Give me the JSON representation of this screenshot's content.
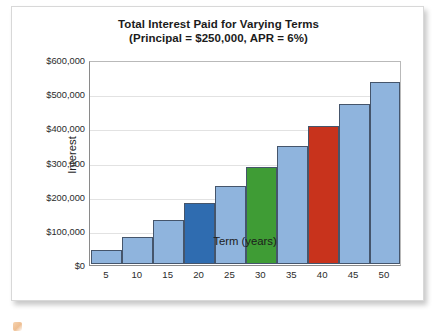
{
  "chart_data": {
    "type": "bar",
    "title": "Total Interest Paid for Varying Terms",
    "subtitle": "(Principal = $250,000, APR = 6%)",
    "xlabel": "Term (years)",
    "ylabel": "Interest",
    "categories": [
      "5",
      "10",
      "15",
      "20",
      "25",
      "30",
      "35",
      "40",
      "45",
      "50"
    ],
    "values": [
      40000,
      80000,
      130000,
      180000,
      232000,
      288000,
      348000,
      408000,
      473000,
      540000
    ],
    "ylim": [
      0,
      600000
    ],
    "ytick_labels": [
      "$600,000",
      "$500,000",
      "$400,000",
      "$300,000",
      "$200,000",
      "$100,000",
      "$0"
    ],
    "ytick_values": [
      600000,
      500000,
      400000,
      300000,
      200000,
      100000,
      0
    ],
    "grid": true,
    "legend": "none",
    "bar_colors": [
      "#8fb4dd",
      "#8fb4dd",
      "#8fb4dd",
      "#2f6cb0",
      "#8fb4dd",
      "#3f9c35",
      "#8fb4dd",
      "#c8331c",
      "#8fb4dd",
      "#8fb4dd"
    ],
    "colors": {
      "default_bar": "#8fb4dd",
      "highlight_blue": "#2f6cb0",
      "highlight_green": "#3f9c35",
      "highlight_red": "#c8331c",
      "bar_border": "#45556b",
      "gridline": "#e2e2e2",
      "axis": "#8a8a8a",
      "text": "#1b1b1b",
      "card_background": "#ffffff"
    }
  }
}
